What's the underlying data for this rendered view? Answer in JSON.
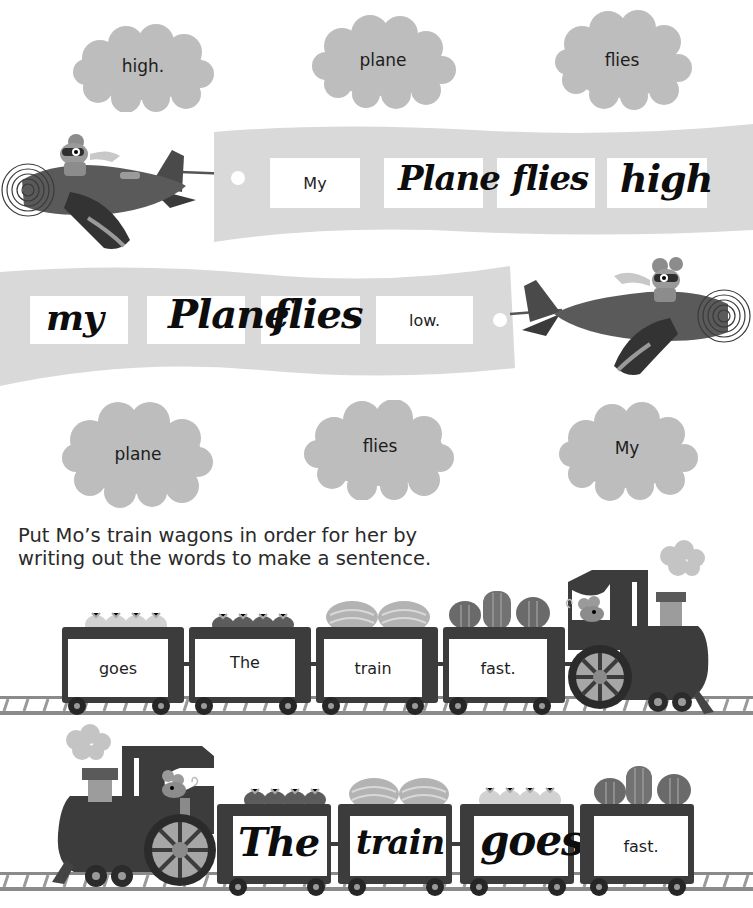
{
  "page": {
    "background": "#ffffff",
    "palette": {
      "cloud": "#bdbdbd",
      "banner": "#d9d9d9",
      "dark": "#3c3c3c",
      "ink": "#0d0d0d"
    }
  },
  "activity1": {
    "top_clouds": [
      {
        "word": "high."
      },
      {
        "word": "plane"
      },
      {
        "word": "flies"
      }
    ],
    "banner1": {
      "slots": [
        {
          "printed": "My",
          "handwritten": ""
        },
        {
          "printed": "",
          "handwritten": "Plane"
        },
        {
          "printed": "",
          "handwritten": "flies"
        },
        {
          "printed": "",
          "handwritten": "high"
        }
      ]
    },
    "banner2": {
      "slots": [
        {
          "printed": "",
          "handwritten": "my"
        },
        {
          "printed": "",
          "handwritten": "Plane"
        },
        {
          "printed": "",
          "handwritten": "flies"
        },
        {
          "printed": "low.",
          "handwritten": ""
        }
      ]
    },
    "bottom_clouds": [
      {
        "word": "plane"
      },
      {
        "word": "flies"
      },
      {
        "word": "My"
      }
    ]
  },
  "activity2": {
    "instruction_line1": "Put Mo’s train wagons in order for her by",
    "instruction_line2": "writing out the words to make a sentence.",
    "train1": {
      "wagons": [
        {
          "word": "goes",
          "cargo": "sacks-light"
        },
        {
          "word": "The",
          "cargo": "sacks-dark"
        },
        {
          "word": "train",
          "cargo": "melons"
        },
        {
          "word": "fast.",
          "cargo": "marrows"
        }
      ]
    },
    "train2": {
      "wagons": [
        {
          "printed": "",
          "handwritten": "The",
          "cargo": "sacks-dark"
        },
        {
          "printed": "",
          "handwritten": "train",
          "cargo": "melons"
        },
        {
          "printed": "",
          "handwritten": "goes",
          "cargo": "sacks-light"
        },
        {
          "printed": "fast.",
          "handwritten": "",
          "cargo": "marrows"
        }
      ]
    }
  }
}
